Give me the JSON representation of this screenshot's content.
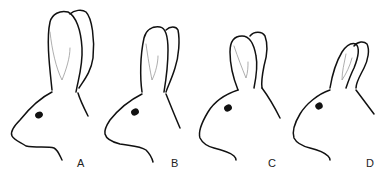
{
  "figure": {
    "type": "line-drawing",
    "colors": {
      "stroke": "#111111",
      "inner_ear": "#999999",
      "background": "#ffffff"
    },
    "panels": [
      {
        "label": "A",
        "ear_length": "longest"
      },
      {
        "label": "B",
        "ear_length": "long"
      },
      {
        "label": "C",
        "ear_length": "medium"
      },
      {
        "label": "D",
        "ear_length": "short"
      }
    ]
  }
}
